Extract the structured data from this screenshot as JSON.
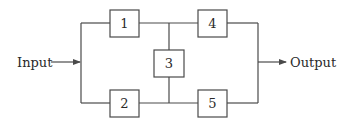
{
  "diagram": {
    "type": "block-diagram",
    "input_label": "Input",
    "output_label": "Output",
    "blocks": [
      {
        "id": "1",
        "label": "1"
      },
      {
        "id": "2",
        "label": "2"
      },
      {
        "id": "3",
        "label": "3"
      },
      {
        "id": "4",
        "label": "4"
      },
      {
        "id": "5",
        "label": "5"
      }
    ],
    "connections": [
      {
        "from": "Input",
        "to": "1"
      },
      {
        "from": "Input",
        "to": "2"
      },
      {
        "from": "1",
        "to": "4"
      },
      {
        "from": "2",
        "to": "5"
      },
      {
        "from": "1-4 junction",
        "to": "3"
      },
      {
        "from": "3",
        "to": "2-5 junction"
      },
      {
        "from": "4",
        "to": "Output"
      },
      {
        "from": "5",
        "to": "Output"
      }
    ],
    "colors": {
      "line": "#4a4a4a",
      "text": "#2a2a2a",
      "background": "#ffffff"
    }
  }
}
